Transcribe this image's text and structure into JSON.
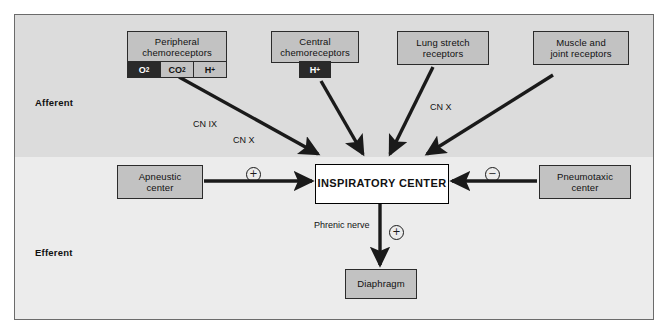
{
  "diagram": {
    "sections": {
      "afferent_label": "Afferent",
      "efferent_label": "Efferent"
    },
    "nodes": {
      "peripheral_chemoreceptors": {
        "label_line1": "Peripheral",
        "label_line2": "chemoreceptors",
        "cells": [
          {
            "label": "O",
            "sub": "2",
            "sup": "",
            "dark": true
          },
          {
            "label": "CO",
            "sub": "2",
            "sup": "",
            "dark": false
          },
          {
            "label": "H",
            "sub": "",
            "sup": "+",
            "dark": false
          }
        ]
      },
      "central_chemoreceptors": {
        "label_line1": "Central",
        "label_line2": "chemoreceptors",
        "cells": [
          {
            "label": "H",
            "sub": "",
            "sup": "+",
            "dark": true
          }
        ]
      },
      "lung_stretch_receptors": {
        "label_line1": "Lung stretch",
        "label_line2": "receptors"
      },
      "muscle_joint_receptors": {
        "label_line1": "Muscle and",
        "label_line2": "joint receptors"
      },
      "apneustic_center": {
        "label_line1": "Apneustic",
        "label_line2": "center"
      },
      "pneumotaxic_center": {
        "label_line1": "Pneumotaxic",
        "label_line2": "center"
      },
      "inspiratory_center": {
        "label": "INSPIRATORY CENTER"
      },
      "diaphragm": {
        "label": "Diaphragm"
      }
    },
    "annotations": {
      "cn_ix": "CN IX",
      "cn_x_left": "CN X",
      "cn_x_right": "CN X",
      "phrenic_nerve_line1": "Phrenic",
      "phrenic_nerve_line2": "nerve",
      "plus_apneustic": "+",
      "minus_pneumotaxic": "−",
      "plus_phrenic": "+"
    },
    "colors": {
      "band_top": "#dcdcdc",
      "band_bottom": "#ececec",
      "node_fill": "#c2c2c2",
      "node_border": "#2b2b2b",
      "dark_cell": "#2a2a2a",
      "arrow": "#1a1a1a",
      "center_fill": "#ffffff"
    }
  }
}
